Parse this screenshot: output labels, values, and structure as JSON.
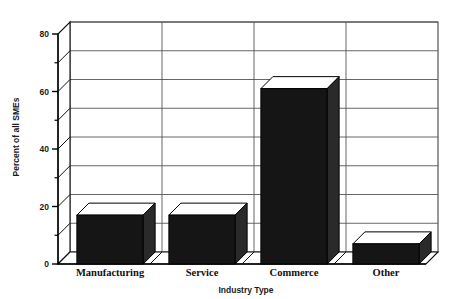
{
  "chart_data": {
    "type": "bar",
    "title": "",
    "subtitle": "",
    "xlabel": "Industry Type",
    "ylabel": "Percent of all SMEs",
    "categories": [
      "Manufacturing",
      "Service",
      "Commerce",
      "Other"
    ],
    "values": [
      17,
      17,
      61,
      7
    ],
    "series": [
      {
        "name": "Percent of all SMEs",
        "values": [
          17,
          17,
          61,
          7
        ]
      }
    ],
    "ylim": [
      0,
      80
    ],
    "xlim": [
      0,
      4
    ],
    "y_major_ticks": [
      0,
      20,
      40,
      60,
      80
    ],
    "y_minor_ticks": [
      10,
      30,
      50,
      70
    ],
    "y_tick_labels": [
      "0",
      "20",
      "40",
      "60",
      "80"
    ],
    "gridlines": {
      "horizontal": true,
      "vertical": true,
      "horizontal_at": [
        10,
        20,
        30,
        40,
        50,
        60,
        70,
        80
      ],
      "color": "#555555"
    },
    "legend": {
      "visible": false,
      "position": "none",
      "entries": []
    },
    "style": {
      "render": "3d",
      "bar_face_color": "#151515",
      "bar_side_color": "#2a2a2a",
      "bar_top_color": "#ffffff",
      "bar_outline_color": "#000000",
      "plot_background": "#ffffff",
      "axis_color": "#000000",
      "depth_px": 12
    },
    "annotations": [],
    "data_labels": {
      "visible": false
    }
  }
}
